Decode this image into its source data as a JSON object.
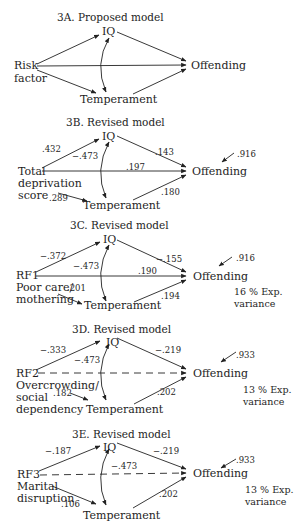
{
  "figure": {
    "panels": [
      {
        "id": "3A",
        "title": "3A.  Proposed model",
        "nodes": {
          "iq": "IQ",
          "risk_line1": "Risk",
          "risk_line2": "factor",
          "outcome": "Offending",
          "mediator": "Temperament"
        },
        "coefficients": {},
        "residual": null,
        "explained_variance": null
      },
      {
        "id": "3B",
        "title": "3B.   Revised model",
        "nodes": {
          "iq": "IQ",
          "risk_line1": "Total",
          "risk_line2": "deprivation",
          "risk_line3": "score",
          "outcome": "Offending",
          "mediator": "Temperament"
        },
        "coefficients": {
          "risk_to_iq": ".432",
          "iq_temperament": "−.473",
          "risk_to_offending": ".197",
          "iq_to_offending": ".143",
          "temperament_to_offending": ".180",
          "risk_to_temperament": ".289"
        },
        "residual": ".916",
        "explained_variance": null
      },
      {
        "id": "3C",
        "title": "3C.   Revised model",
        "nodes": {
          "iq": "IQ",
          "risk_line1": "RF1",
          "risk_line2": "Poor care/",
          "risk_line3": "mothering",
          "outcome": "Offending",
          "mediator": "Temperament"
        },
        "coefficients": {
          "risk_to_iq": "−.372",
          "iq_temperament": "−.473",
          "risk_to_offending": ".190",
          "iq_to_offending": "−.155",
          "temperament_to_offending": ".194",
          "risk_to_temperament": ".201"
        },
        "residual": ".916",
        "explained_variance": {
          "line1": "16 % Exp.",
          "line2": "variance"
        }
      },
      {
        "id": "3D",
        "title": "3D.   Revised model",
        "nodes": {
          "iq": "IQ",
          "risk_line1": "RF2",
          "risk_line2": "Overcrowding/",
          "risk_line3": "social",
          "risk_line4": "dependency",
          "outcome": "Offending",
          "mediator": "Temperament"
        },
        "coefficients": {
          "risk_to_iq": "−.333",
          "iq_temperament": "−.473",
          "risk_to_offending": null,
          "iq_to_offending": "−.219",
          "temperament_to_offending": ".202",
          "risk_to_temperament": ".182"
        },
        "residual": ".933",
        "explained_variance": {
          "line1": "13 % Exp.",
          "line2": "variance"
        }
      },
      {
        "id": "3E",
        "title": "3E.   Revised model",
        "nodes": {
          "iq": "IQ",
          "risk_line1": "RF3",
          "risk_line2": "Marital",
          "risk_line3": "disruption",
          "outcome": "Offending",
          "mediator": "Temperament"
        },
        "coefficients": {
          "risk_to_iq": "−.187",
          "iq_temperament": "−.473",
          "risk_to_offending": null,
          "iq_to_offending": "−.219",
          "temperament_to_offending": ".202",
          "risk_to_temperament": ".106"
        },
        "residual": ".933",
        "explained_variance": {
          "line1": "13 % Exp.",
          "line2": "variance"
        }
      }
    ],
    "colors": {
      "ink": "#1e1e1e",
      "background": "#ffffff"
    }
  }
}
